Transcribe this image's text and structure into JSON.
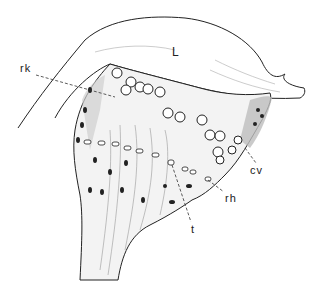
{
  "figure": {
    "labels": [
      {
        "id": "L",
        "text": "L",
        "x": 172,
        "y": 46
      },
      {
        "id": "rk",
        "text": "rk",
        "x": 20,
        "y": 63
      },
      {
        "id": "cv",
        "text": "cv",
        "x": 250,
        "y": 165
      },
      {
        "id": "rh",
        "text": "rh",
        "x": 225,
        "y": 193
      },
      {
        "id": "t",
        "text": "t",
        "x": 191,
        "y": 224
      }
    ],
    "colors": {
      "ink": "#222222",
      "shade": "#bdbdbd",
      "background": "#ffffff"
    }
  }
}
